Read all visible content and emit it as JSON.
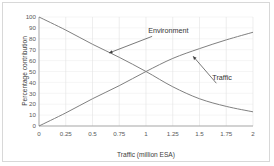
{
  "chart_data": {
    "type": "line",
    "title": "",
    "xlabel": "Traffic (million ESA)",
    "ylabel": "Percentage contribution",
    "xlim": [
      0,
      2
    ],
    "ylim": [
      0,
      100
    ],
    "xticks": [
      "0",
      "0.25",
      "0.5",
      "0.75",
      "1",
      "1.25",
      "1.5",
      "1.75",
      "2"
    ],
    "xtick_values": [
      0,
      0.25,
      0.5,
      0.75,
      1,
      1.25,
      1.5,
      1.75,
      2
    ],
    "yticks": [
      "0",
      "10",
      "20",
      "30",
      "40",
      "50",
      "60",
      "70",
      "80",
      "90",
      "100"
    ],
    "ytick_values": [
      0,
      10,
      20,
      30,
      40,
      50,
      60,
      70,
      80,
      90,
      100
    ],
    "grid": "both-faint-vertical-major",
    "legend": "none-inline-annotations",
    "line_color": "#808080",
    "series": [
      {
        "name": "Environment",
        "x": [
          0,
          0.25,
          0.5,
          0.75,
          1,
          1.25,
          1.5,
          1.75,
          2
        ],
        "values": [
          100,
          88,
          75,
          63,
          50,
          36,
          25,
          18,
          13
        ]
      },
      {
        "name": "Traffic",
        "x": [
          0,
          0.25,
          0.5,
          0.75,
          1,
          1.25,
          1.5,
          1.75,
          2
        ],
        "values": [
          0,
          12,
          25,
          37,
          50,
          62,
          71,
          79,
          86
        ]
      }
    ],
    "annotations": [
      {
        "text": "Environment",
        "label_x": 1.02,
        "label_y": 85,
        "arrow_tip_x": 0.655,
        "arrow_tip_y": 67
      },
      {
        "text": "Traffic",
        "label_x": 1.62,
        "label_y": 42,
        "arrow_tip_x": 1.44,
        "arrow_tip_y": 64
      }
    ]
  }
}
